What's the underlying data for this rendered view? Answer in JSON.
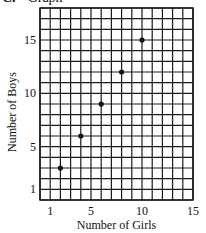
{
  "heading": {
    "letter": "C.",
    "title": "Graph"
  },
  "chart_data": {
    "type": "scatter",
    "title": "Graph",
    "xlabel": "Number of Girls",
    "ylabel": "Number of Boys",
    "xlim": [
      0,
      15
    ],
    "ylim": [
      0,
      18
    ],
    "grid": true,
    "x_ticks": [
      1,
      5,
      10,
      15
    ],
    "y_ticks": [
      1,
      5,
      10,
      15
    ],
    "x_tick_labels": [
      "1",
      "5",
      "10",
      "15"
    ],
    "y_tick_labels": [
      "1",
      "5",
      "10",
      "15"
    ],
    "series": [
      {
        "name": "Girls vs Boys",
        "points": [
          {
            "x": 2,
            "y": 3
          },
          {
            "x": 4,
            "y": 6
          },
          {
            "x": 6,
            "y": 9
          },
          {
            "x": 8,
            "y": 12
          },
          {
            "x": 10,
            "y": 15
          }
        ]
      }
    ],
    "colors": {
      "grid": "#1a1a1a",
      "point": "#111111",
      "background": "#ffffff"
    }
  }
}
